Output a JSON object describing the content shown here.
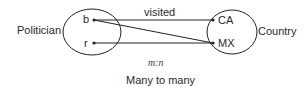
{
  "diagram": {
    "left_set": {
      "label": "Politician",
      "members": [
        "b",
        "r"
      ]
    },
    "right_set": {
      "label": "Country",
      "members": [
        "CA",
        "MX"
      ]
    },
    "relation_label": "visited",
    "mappings": [
      {
        "from": "b",
        "to": "CA"
      },
      {
        "from": "b",
        "to": "MX"
      },
      {
        "from": "r",
        "to": "MX"
      }
    ],
    "cardinality": "m:n",
    "caption": "Many to many",
    "colors": {
      "stroke": "#222222",
      "text": "#2a2a2a"
    }
  }
}
